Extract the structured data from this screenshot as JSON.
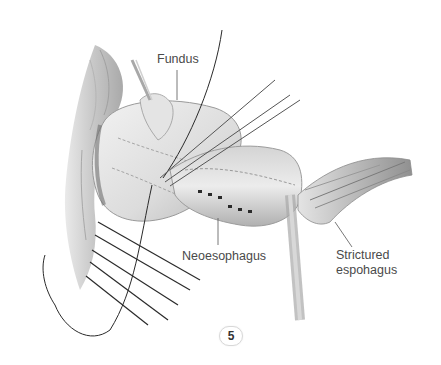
{
  "figure": {
    "number": "5",
    "labels": {
      "fundus": "Fundus",
      "neoesophagus": "Neoesophagus",
      "strictured_esophagus": "Strictured espohagus"
    }
  },
  "colors": {
    "text": "#4a4a4a",
    "tissue_light": "#e8e8e8",
    "tissue_mid": "#c4c4c4",
    "tissue_dark": "#8a8a8a",
    "suture": "#2a2a2a"
  }
}
